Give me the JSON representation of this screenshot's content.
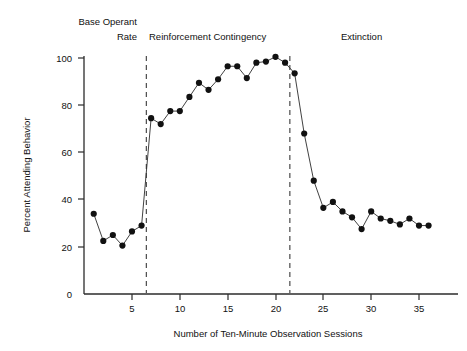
{
  "chart_data": {
    "type": "line",
    "title": "",
    "xlabel": "Number of Ten-Minute Observation Sessions",
    "ylabel": "Percent Attending Behavior",
    "xlim": [
      0,
      37
    ],
    "ylim": [
      0,
      100
    ],
    "grid": false,
    "legend": "none",
    "xticks": [
      5,
      10,
      15,
      20,
      25,
      30,
      35
    ],
    "yticks": [
      0,
      20,
      40,
      60,
      80,
      100
    ],
    "x": [
      1,
      2,
      3,
      4,
      5,
      6,
      7,
      8,
      9,
      10,
      11,
      12,
      13,
      14,
      15,
      16,
      17,
      18,
      19,
      20,
      21,
      22,
      23,
      24,
      25,
      26,
      27,
      28,
      29,
      30,
      31,
      32,
      33,
      34,
      35,
      36
    ],
    "values": [
      34,
      22.5,
      25,
      20.5,
      26.5,
      29,
      74.5,
      72,
      77.5,
      77.5,
      83.5,
      89.5,
      86.5,
      91,
      96.5,
      96.5,
      91.5,
      98,
      98.5,
      100.5,
      98,
      93.5,
      68,
      48,
      36.5,
      39,
      35,
      32.5,
      27.5,
      35,
      32,
      31,
      29.5,
      32,
      29,
      29
    ],
    "series": [
      {
        "name": "Percent Attending Behavior",
        "values": [
          34,
          22.5,
          25,
          20.5,
          26.5,
          29,
          74.5,
          72,
          77.5,
          77.5,
          83.5,
          89.5,
          86.5,
          91,
          96.5,
          96.5,
          91.5,
          98,
          98.5,
          100.5,
          98,
          93.5,
          68,
          48,
          36.5,
          39,
          35,
          32.5,
          27.5,
          35,
          32,
          31,
          29.5,
          32,
          29,
          29
        ]
      }
    ],
    "phases": [
      {
        "id": "base-operant-rate",
        "label_line1": "Base Operant",
        "label_line2": "Rate",
        "x_start": 0,
        "x_end": 6.5
      },
      {
        "id": "reinforcement-contingency",
        "label_line1": "Reinforcement Contingency",
        "label_line2": "",
        "x_start": 6.5,
        "x_end": 21.5
      },
      {
        "id": "extinction",
        "label_line1": "Extinction",
        "label_line2": "",
        "x_start": 21.5,
        "x_end": 37
      }
    ],
    "dividers": [
      6.5,
      21.5
    ],
    "marker_color": "#111111",
    "line_color": "#2b2b2b",
    "divider_color": "#4a4a4a",
    "background_color": "#ffffff"
  },
  "annotations": {
    "phase1_line1": "Base Operant",
    "phase1_line2": "Rate",
    "phase2": "Reinforcement Contingency",
    "phase3": "Extinction"
  },
  "axes": {
    "y_tick_labels": [
      "100",
      "80",
      "60",
      "40",
      "20",
      "0"
    ],
    "x_tick_labels": [
      "5",
      "10",
      "15",
      "20",
      "25",
      "30",
      "35"
    ],
    "y_title": "Percent Attending Behavior",
    "x_title": "Number of Ten-Minute Observation Sessions"
  }
}
